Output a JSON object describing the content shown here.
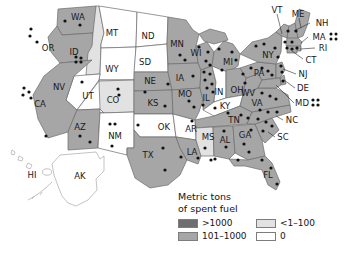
{
  "legend": {
    "title_line1": "Metric tons",
    "title_line2": "of spent fuel",
    "items": [
      {
        "label": ">1000",
        "color": "#6e6e6e"
      },
      {
        "label": "101–1000",
        "color": "#a6a6a6"
      },
      {
        "label": "<1–100",
        "color": "#e2e2e2"
      },
      {
        "label": "0",
        "color": "#ffffff"
      }
    ]
  },
  "map": {
    "colors": {
      "high": "#6e6e6e",
      "mid": "#a6a6a6",
      "low": "#e2e2e2",
      "zero": "#ffffff",
      "border": "#6b6b6b",
      "dot": "#111111"
    },
    "states": [
      {
        "code": "WA",
        "category": "101-1000",
        "label_x": 78,
        "label_y": 17
      },
      {
        "code": "OR",
        "category": "101-1000",
        "label_x": 48,
        "label_y": 48
      },
      {
        "code": "ID",
        "category": "<1-100",
        "label_x": 74,
        "label_y": 52
      },
      {
        "code": "MT",
        "category": "0",
        "label_x": 112,
        "label_y": 33
      },
      {
        "code": "WY",
        "category": "0",
        "label_x": 112,
        "label_y": 69
      },
      {
        "code": "NV",
        "category": "0",
        "label_x": 59,
        "label_y": 87
      },
      {
        "code": "UT",
        "category": "0",
        "label_x": 88,
        "label_y": 96
      },
      {
        "code": "CA",
        "category": "101-1000",
        "label_x": 40,
        "label_y": 104
      },
      {
        "code": "AZ",
        "category": "101-1000",
        "label_x": 80,
        "label_y": 127
      },
      {
        "code": "CO",
        "category": "<1-100",
        "label_x": 113,
        "label_y": 100
      },
      {
        "code": "NM",
        "category": "0",
        "label_x": 115,
        "label_y": 136
      },
      {
        "code": "ND",
        "category": "0",
        "label_x": 148,
        "label_y": 36
      },
      {
        "code": "SD",
        "category": "0",
        "label_x": 145,
        "label_y": 62
      },
      {
        "code": "NE",
        "category": "101-1000",
        "label_x": 150,
        "label_y": 81
      },
      {
        "code": "KS",
        "category": "101-1000",
        "label_x": 153,
        "label_y": 103
      },
      {
        "code": "OK",
        "category": "0",
        "label_x": 164,
        "label_y": 127
      },
      {
        "code": "TX",
        "category": "101-1000",
        "label_x": 148,
        "label_y": 155
      },
      {
        "code": "MN",
        "category": "101-1000",
        "label_x": 177,
        "label_y": 44
      },
      {
        "code": "IA",
        "category": "101-1000",
        "label_x": 180,
        "label_y": 78
      },
      {
        "code": "MO",
        "category": "101-1000",
        "label_x": 185,
        "label_y": 94
      },
      {
        "code": "AR",
        "category": "0",
        "label_x": 191,
        "label_y": 129
      },
      {
        "code": "LA",
        "category": "101-1000",
        "label_x": 192,
        "label_y": 152
      },
      {
        "code": "WI",
        "category": "101-1000",
        "label_x": 196,
        "label_y": 53
      },
      {
        "code": "IL",
        "category": "101-1000",
        "label_x": 206,
        "label_y": 98
      },
      {
        "code": "IN",
        "category": "0",
        "label_x": 219,
        "label_y": 92
      },
      {
        "code": "MI",
        "category": "101-1000",
        "label_x": 228,
        "label_y": 62
      },
      {
        "code": "OH",
        "category": "101-1000",
        "label_x": 237,
        "label_y": 90
      },
      {
        "code": "KY",
        "category": "0",
        "label_x": 225,
        "label_y": 106
      },
      {
        "code": "TN",
        "category": "101-1000",
        "label_x": 234,
        "label_y": 120
      },
      {
        "code": "MS",
        "category": "<1-100",
        "label_x": 208,
        "label_y": 137
      },
      {
        "code": "AL",
        "category": "101-1000",
        "label_x": 225,
        "label_y": 140
      },
      {
        "code": "GA",
        "category": "101-1000",
        "label_x": 245,
        "label_y": 135
      },
      {
        "code": "FL",
        "category": "101-1000",
        "label_x": 268,
        "label_y": 175
      },
      {
        "code": "SC",
        "category": "101-1000",
        "label_x": 283,
        "label_y": 137
      },
      {
        "code": "NC",
        "category": "101-1000",
        "label_x": 292,
        "label_y": 120
      },
      {
        "code": "VA",
        "category": "101-1000",
        "label_x": 257,
        "label_y": 103
      },
      {
        "code": "WV",
        "category": "101-1000",
        "label_x": 248,
        "label_y": 93
      },
      {
        "code": "PA",
        "category": "101-1000",
        "label_x": 259,
        "label_y": 73
      },
      {
        "code": "NY",
        "category": "101-1000",
        "label_x": 268,
        "label_y": 55
      },
      {
        "code": "VT",
        "category": "101-1000",
        "label_x": 277,
        "label_y": 10
      },
      {
        "code": "ME",
        "category": "101-1000",
        "label_x": 298,
        "label_y": 14
      },
      {
        "code": "NH",
        "category": "101-1000",
        "label_x": 322,
        "label_y": 23
      },
      {
        "code": "MA",
        "category": "101-1000",
        "label_x": 319,
        "label_y": 37
      },
      {
        "code": "RI",
        "category": "101-1000",
        "label_x": 323,
        "label_y": 48
      },
      {
        "code": "CT",
        "category": "101-1000",
        "label_x": 311,
        "label_y": 60
      },
      {
        "code": "NJ",
        "category": "101-1000",
        "label_x": 303,
        "label_y": 74
      },
      {
        "code": "DE",
        "category": "101-1000",
        "label_x": 303,
        "label_y": 88
      },
      {
        "code": "MD",
        "category": "101-1000",
        "label_x": 303,
        "label_y": 103
      },
      {
        "code": "HI",
        "category": "0",
        "label_x": 32,
        "label_y": 175
      },
      {
        "code": "AK",
        "category": "0",
        "label_x": 80,
        "label_y": 176
      }
    ],
    "marker_note": "black dots mark nuclear reactor / storage sites"
  }
}
